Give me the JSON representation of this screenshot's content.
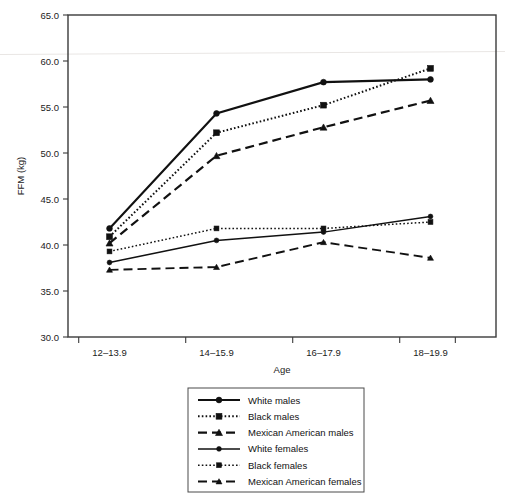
{
  "chart_data": {
    "type": "line",
    "title": "",
    "xlabel": "Age",
    "ylabel": "FFM (kg)",
    "categories": [
      "12–13.9",
      "14–15.9",
      "16–17.9",
      "18–19.9"
    ],
    "ylim": [
      30.0,
      65.0
    ],
    "yticks": [
      "30.0",
      "35.0",
      "40.0",
      "45.0",
      "50.0",
      "55.0",
      "60.0",
      "65.0"
    ],
    "ytick_values": [
      30.0,
      35.0,
      40.0,
      45.0,
      50.0,
      55.0,
      60.0,
      65.0
    ],
    "grid": false,
    "legend_position": "below-center",
    "series": [
      {
        "name": "White males",
        "values": [
          41.8,
          54.3,
          57.7,
          58.0
        ],
        "line_style": "solid",
        "marker": "circle",
        "color": "#111111"
      },
      {
        "name": "Black males",
        "values": [
          40.9,
          52.2,
          55.2,
          59.2
        ],
        "line_style": "dotted",
        "marker": "square",
        "color": "#111111"
      },
      {
        "name": "Mexican American males",
        "values": [
          40.2,
          49.7,
          52.8,
          55.7
        ],
        "line_style": "dashed",
        "marker": "triangle",
        "color": "#111111"
      },
      {
        "name": "White females",
        "values": [
          38.1,
          40.5,
          41.4,
          43.1
        ],
        "line_style": "solid",
        "marker": "circle",
        "color": "#111111"
      },
      {
        "name": "Black females",
        "values": [
          39.3,
          41.8,
          41.8,
          42.5
        ],
        "line_style": "dotted",
        "marker": "square",
        "color": "#111111"
      },
      {
        "name": "Mexican American females",
        "values": [
          37.3,
          37.6,
          40.3,
          38.6
        ],
        "line_style": "dashed",
        "marker": "triangle",
        "color": "#111111"
      }
    ]
  },
  "axes": {
    "y_title": "FFM (kg)",
    "x_title": "Age"
  },
  "legend": {
    "entries": [
      {
        "label": "White males"
      },
      {
        "label": "Black males"
      },
      {
        "label": "Mexican American males"
      },
      {
        "label": "White females"
      },
      {
        "label": "Black females"
      },
      {
        "label": "Mexican American females"
      }
    ]
  }
}
